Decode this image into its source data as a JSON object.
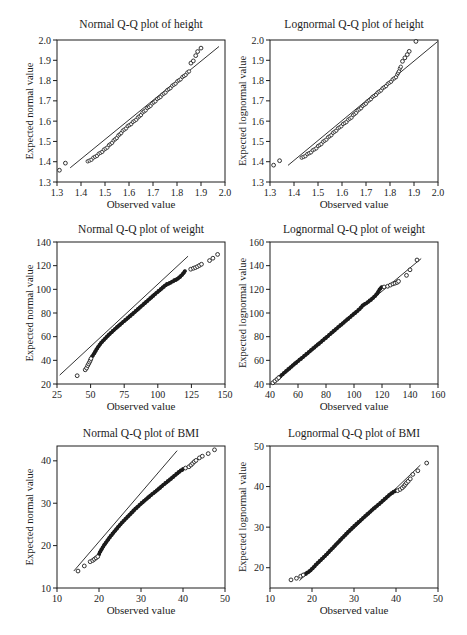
{
  "figure": {
    "background": "#ffffff",
    "ink": "#1c1c1c"
  },
  "chart_data": [
    {
      "type": "scatter",
      "title": "Normal Q-Q plot of height",
      "xlabel": "Observed value",
      "ylabel": "Expected normal value",
      "xlim": [
        1.3,
        2.0
      ],
      "ylim": [
        1.3,
        2.0
      ],
      "xticks": [
        1.3,
        1.4,
        1.5,
        1.6,
        1.7,
        1.8,
        1.9,
        2.0
      ],
      "yticks": [
        1.3,
        1.4,
        1.5,
        1.6,
        1.7,
        1.8,
        1.9,
        2.0
      ],
      "tick_decimals": 1,
      "grid": false,
      "legend": "none",
      "line": [
        1.355,
        1.37,
        1.975,
        1.968
      ],
      "points": [
        [
          1.31,
          1.358
        ],
        [
          1.335,
          1.393
        ],
        [
          1.858,
          1.886
        ],
        [
          1.868,
          1.897
        ],
        [
          1.878,
          1.923
        ],
        [
          1.886,
          1.943
        ],
        [
          1.9,
          1.96
        ]
      ],
      "band": [
        [
          1.428,
          1.4
        ],
        [
          1.448,
          1.415
        ],
        [
          1.468,
          1.432
        ],
        [
          1.488,
          1.45
        ],
        [
          1.508,
          1.47
        ],
        [
          1.528,
          1.493
        ],
        [
          1.55,
          1.52
        ],
        [
          1.572,
          1.549
        ],
        [
          1.594,
          1.573
        ],
        [
          1.616,
          1.594
        ],
        [
          1.638,
          1.617
        ],
        [
          1.66,
          1.645
        ],
        [
          1.685,
          1.672
        ],
        [
          1.71,
          1.7
        ],
        [
          1.74,
          1.73
        ],
        [
          1.77,
          1.762
        ],
        [
          1.8,
          1.793
        ],
        [
          1.825,
          1.818
        ],
        [
          1.85,
          1.845
        ]
      ],
      "band_n": 62,
      "band_style": "rings"
    },
    {
      "type": "scatter",
      "title": "Lognormal Q-Q plot of height",
      "xlabel": "Observed value",
      "ylabel": "Expected lognormal value",
      "xlim": [
        1.3,
        2.0
      ],
      "ylim": [
        1.3,
        2.0
      ],
      "xticks": [
        1.3,
        1.4,
        1.5,
        1.6,
        1.7,
        1.8,
        1.9,
        2.0
      ],
      "yticks": [
        1.3,
        1.4,
        1.5,
        1.6,
        1.7,
        1.8,
        1.9,
        2.0
      ],
      "tick_decimals": 1,
      "grid": false,
      "legend": "none",
      "line": [
        1.375,
        1.382,
        1.998,
        1.992
      ],
      "points": [
        [
          1.315,
          1.383
        ],
        [
          1.34,
          1.405
        ],
        [
          1.852,
          1.895
        ],
        [
          1.862,
          1.912
        ],
        [
          1.872,
          1.928
        ],
        [
          1.88,
          1.944
        ],
        [
          1.908,
          1.993
        ]
      ],
      "band": [
        [
          1.432,
          1.418
        ],
        [
          1.452,
          1.433
        ],
        [
          1.472,
          1.449
        ],
        [
          1.492,
          1.467
        ],
        [
          1.512,
          1.487
        ],
        [
          1.532,
          1.508
        ],
        [
          1.553,
          1.53
        ],
        [
          1.574,
          1.553
        ],
        [
          1.596,
          1.576
        ],
        [
          1.618,
          1.597
        ],
        [
          1.64,
          1.62
        ],
        [
          1.663,
          1.648
        ],
        [
          1.688,
          1.675
        ],
        [
          1.715,
          1.705
        ],
        [
          1.745,
          1.735
        ],
        [
          1.775,
          1.766
        ],
        [
          1.805,
          1.797
        ],
        [
          1.828,
          1.822
        ],
        [
          1.845,
          1.868
        ]
      ],
      "band_n": 62,
      "band_style": "rings"
    },
    {
      "type": "scatter",
      "title": "Normal Q-Q plot of weight",
      "xlabel": "Observed value",
      "ylabel": "Expected normal value",
      "xlim": [
        25,
        150
      ],
      "ylim": [
        20,
        140
      ],
      "xticks": [
        25,
        50,
        75,
        100,
        125,
        150
      ],
      "yticks": [
        20,
        40,
        60,
        80,
        100,
        120,
        140
      ],
      "tick_decimals": 0,
      "grid": false,
      "legend": "none",
      "line": [
        27,
        27.5,
        122.5,
        128
      ],
      "points": [
        [
          40,
          27
        ],
        [
          46,
          32
        ],
        [
          47,
          33.5
        ],
        [
          47.8,
          35.5
        ],
        [
          48.5,
          37
        ],
        [
          49.2,
          38.5
        ],
        [
          49.8,
          40
        ],
        [
          50.3,
          41.5
        ],
        [
          124.5,
          117
        ],
        [
          126.5,
          117.8
        ],
        [
          128,
          118.4
        ],
        [
          129.5,
          119.2
        ],
        [
          131,
          120.2
        ],
        [
          132.5,
          121.2
        ],
        [
          138.5,
          124.3
        ],
        [
          141,
          126.3
        ],
        [
          144.5,
          129.5
        ]
      ],
      "band": [
        [
          51,
          43
        ],
        [
          52.5,
          45.5
        ],
        [
          54,
          48.5
        ],
        [
          56,
          52
        ],
        [
          58,
          55
        ],
        [
          60.5,
          58
        ],
        [
          63.5,
          61.5
        ],
        [
          67,
          65.3
        ],
        [
          71,
          69.3
        ],
        [
          75,
          73.2
        ],
        [
          79,
          77
        ],
        [
          83,
          81
        ],
        [
          87,
          85
        ],
        [
          91,
          89
        ],
        [
          95,
          93
        ],
        [
          99,
          97
        ],
        [
          102.5,
          100.3
        ],
        [
          105,
          102.8
        ],
        [
          106.8,
          104.3
        ],
        [
          108.5,
          105
        ],
        [
          110,
          106
        ],
        [
          112,
          107.3
        ],
        [
          114,
          108.4
        ],
        [
          116,
          110
        ],
        [
          117.8,
          112
        ],
        [
          119.2,
          113.8
        ],
        [
          120.3,
          115.5
        ]
      ],
      "band_n": 140,
      "band_style": "solid"
    },
    {
      "type": "scatter",
      "title": "Lognormal Q-Q plot of weight",
      "xlabel": "Observed value",
      "ylabel": "Expected lognormal value",
      "xlim": [
        40,
        160
      ],
      "ylim": [
        40,
        160
      ],
      "xticks": [
        40,
        60,
        80,
        100,
        120,
        140,
        160
      ],
      "yticks": [
        40,
        60,
        80,
        100,
        120,
        140,
        160
      ],
      "tick_decimals": 0,
      "grid": false,
      "legend": "none",
      "line": [
        40.5,
        40,
        148,
        146
      ],
      "points": [
        [
          42,
          41
        ],
        [
          43.5,
          42.5
        ],
        [
          45,
          44
        ],
        [
          46.2,
          45.3
        ],
        [
          121.5,
          122
        ],
        [
          124,
          122.6
        ],
        [
          126,
          123.6
        ],
        [
          127.8,
          124.6
        ],
        [
          129.3,
          125.2
        ],
        [
          130.8,
          125.8
        ],
        [
          131.8,
          126.8
        ],
        [
          137.5,
          131.8
        ],
        [
          140,
          136.5
        ],
        [
          145,
          144.8
        ]
      ],
      "band": [
        [
          46.5,
          45.6
        ],
        [
          49,
          48.2
        ],
        [
          52,
          51.3
        ],
        [
          55,
          54.4
        ],
        [
          58,
          57.4
        ],
        [
          61.5,
          60.8
        ],
        [
          65,
          64.2
        ],
        [
          69,
          68.2
        ],
        [
          73,
          72.2
        ],
        [
          77.5,
          76.6
        ],
        [
          82,
          81.2
        ],
        [
          86.5,
          85.8
        ],
        [
          91,
          90.3
        ],
        [
          95,
          94.3
        ],
        [
          99,
          98.3
        ],
        [
          102.5,
          101.8
        ],
        [
          105,
          104.6
        ],
        [
          106.5,
          106.8
        ],
        [
          108,
          107.6
        ],
        [
          110,
          109.3
        ],
        [
          112.5,
          111.6
        ],
        [
          115,
          114.3
        ],
        [
          116.8,
          116.8
        ],
        [
          117.8,
          119
        ],
        [
          118.8,
          120.8
        ],
        [
          120,
          122
        ]
      ],
      "band_n": 140,
      "band_style": "solid"
    },
    {
      "type": "scatter",
      "title": "Normal Q-Q plot of BMI",
      "xlabel": "Observed value",
      "ylabel": "Expected normal value",
      "xlim": [
        10,
        50
      ],
      "ylim": [
        10,
        43.5
      ],
      "xticks": [
        10,
        20,
        30,
        40,
        50
      ],
      "yticks": [
        10,
        20,
        30,
        40
      ],
      "tick_decimals": 0,
      "grid": false,
      "legend": "none",
      "line": [
        14,
        14,
        38.6,
        42.4
      ],
      "points": [
        [
          15,
          14
        ],
        [
          16.5,
          15.2
        ],
        [
          17.9,
          16.2
        ],
        [
          18.5,
          16.5
        ],
        [
          18.9,
          16.8
        ],
        [
          19.3,
          17.1
        ],
        [
          19.7,
          17.4
        ],
        [
          40.6,
          38.3
        ],
        [
          41.4,
          38.6
        ],
        [
          41.9,
          39
        ],
        [
          42.3,
          39.4
        ],
        [
          42.7,
          39.8
        ],
        [
          43.1,
          40.1
        ],
        [
          43.9,
          40.7
        ],
        [
          44.6,
          41.1
        ],
        [
          46,
          41.7
        ],
        [
          47.5,
          42.6
        ]
      ],
      "band": [
        [
          19.9,
          17.7
        ],
        [
          20.2,
          18.4
        ],
        [
          20.6,
          19.1
        ],
        [
          21.2,
          20.1
        ],
        [
          22,
          21.2
        ],
        [
          22.9,
          22.4
        ],
        [
          23.9,
          23.6
        ],
        [
          25,
          24.9
        ],
        [
          26.2,
          26.2
        ],
        [
          27.4,
          27.4
        ],
        [
          28.7,
          28.7
        ],
        [
          30,
          29.9
        ],
        [
          31.3,
          31
        ],
        [
          32.6,
          32.1
        ],
        [
          34,
          33.2
        ],
        [
          35.4,
          34.4
        ],
        [
          36.8,
          35.5
        ],
        [
          38.1,
          36.6
        ],
        [
          39.2,
          37.5
        ],
        [
          40,
          38
        ]
      ],
      "band_n": 130,
      "band_style": "solid"
    },
    {
      "type": "scatter",
      "title": "Lognormal Q-Q plot of BMI",
      "xlabel": "Observed value",
      "ylabel": "Expected lognormal value",
      "xlim": [
        10,
        50
      ],
      "ylim": [
        15,
        50
      ],
      "xticks": [
        10,
        20,
        30,
        40,
        50
      ],
      "yticks": [
        20,
        30,
        40,
        50
      ],
      "tick_decimals": 0,
      "grid": false,
      "legend": "none",
      "line": [
        17,
        16.8,
        45.8,
        45.3
      ],
      "points": [
        [
          15,
          17
        ],
        [
          16.3,
          17.4
        ],
        [
          17.3,
          17.9
        ],
        [
          17.9,
          18.2
        ],
        [
          40.4,
          39
        ],
        [
          41,
          39.3
        ],
        [
          41.5,
          39.7
        ],
        [
          41.9,
          40.1
        ],
        [
          42.2,
          40.5
        ],
        [
          42.5,
          40.9
        ],
        [
          42.9,
          41.3
        ],
        [
          43.4,
          41.9
        ],
        [
          44,
          43
        ],
        [
          45.2,
          43.9
        ],
        [
          47.3,
          45.8
        ]
      ],
      "band": [
        [
          18.2,
          18.3
        ],
        [
          18.8,
          18.7
        ],
        [
          19.5,
          19.2
        ],
        [
          20.2,
          19.9
        ],
        [
          21,
          20.8
        ],
        [
          22,
          21.8
        ],
        [
          23.2,
          23
        ],
        [
          24.5,
          24.4
        ],
        [
          25.8,
          25.8
        ],
        [
          27.2,
          27.3
        ],
        [
          28.6,
          28.8
        ],
        [
          30,
          30.2
        ],
        [
          31.5,
          31.6
        ],
        [
          33,
          33
        ],
        [
          34.5,
          34.4
        ],
        [
          36,
          35.7
        ],
        [
          37.4,
          37
        ],
        [
          38.6,
          38.1
        ],
        [
          39.6,
          38.8
        ],
        [
          40,
          39
        ]
      ],
      "band_n": 130,
      "band_style": "solid"
    }
  ]
}
